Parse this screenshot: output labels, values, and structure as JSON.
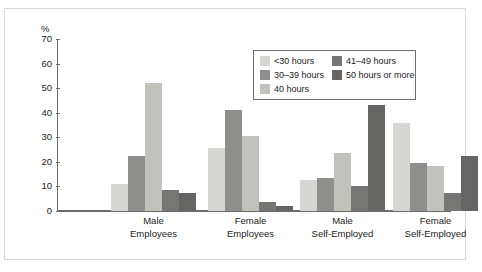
{
  "chart_data": {
    "type": "bar",
    "title": "",
    "subtitle": "",
    "xlabel": "",
    "ylabel": "%",
    "ylim": [
      0,
      70
    ],
    "yticks": [
      0,
      10,
      20,
      30,
      40,
      50,
      60,
      70
    ],
    "grid": false,
    "legend_position": "top-right",
    "categories": [
      "Male Employees",
      "Female Employees",
      "Male Self-Employed",
      "Female Self-Employed"
    ],
    "category_lines": [
      [
        "Male",
        "Employees"
      ],
      [
        "Female",
        "Employees"
      ],
      [
        "Male",
        "Self-Employed"
      ],
      [
        "Female",
        "Self-Employed"
      ]
    ],
    "series": [
      {
        "name": "<30 hours",
        "color": "#d6d6d2",
        "values": [
          11,
          25.5,
          12.5,
          36
        ]
      },
      {
        "name": "30–39 hours",
        "color": "#8f8f8d",
        "values": [
          22.5,
          41,
          13.5,
          19.5
        ]
      },
      {
        "name": "40 hours",
        "color": "#c2c2bd",
        "values": [
          52,
          30.5,
          23.5,
          18.5
        ]
      },
      {
        "name": "41–49 hours",
        "color": "#767674",
        "values": [
          8.5,
          3.5,
          10,
          7.5
        ]
      },
      {
        "name": "50 hours or more",
        "color": "#656563",
        "values": [
          7.5,
          2,
          43,
          22.5
        ]
      }
    ]
  },
  "legend": {
    "columns": [
      [
        "<30 hours",
        "30–39 hours",
        "40 hours"
      ],
      [
        "41–49 hours",
        "50 hours or more"
      ]
    ]
  },
  "colors": {
    "axis": "#6b6b6b",
    "text": "#1c1c1c",
    "legend_border": "#707070",
    "figure_border": "#d8d8d8",
    "background": "#ffffff"
  }
}
